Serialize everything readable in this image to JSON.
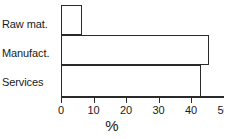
{
  "chart_data": {
    "type": "bar",
    "orientation": "horizontal",
    "title": "",
    "subtitle": "",
    "xlabel": "%",
    "ylabel": "",
    "categories": [
      "Raw mat.",
      "Manufact.",
      "Services"
    ],
    "values": [
      6.5,
      45.5,
      43
    ],
    "series": [
      {
        "name": "",
        "values": [
          6.5,
          45.5,
          43
        ]
      }
    ],
    "xlim": [
      0,
      50
    ],
    "xticks": [
      0,
      10,
      20,
      30,
      40,
      50
    ],
    "xtick_labels": [
      "0",
      "10",
      "20",
      "30",
      "40",
      "50"
    ],
    "grid": false,
    "legend": false,
    "legend_position": "none",
    "bar_fill": "#ffffff",
    "bar_edge": "#2a2a2a",
    "axis_color": "#2a2a2a",
    "text_color": "#1a1a1a",
    "background": "#ffffff",
    "annotations": []
  }
}
